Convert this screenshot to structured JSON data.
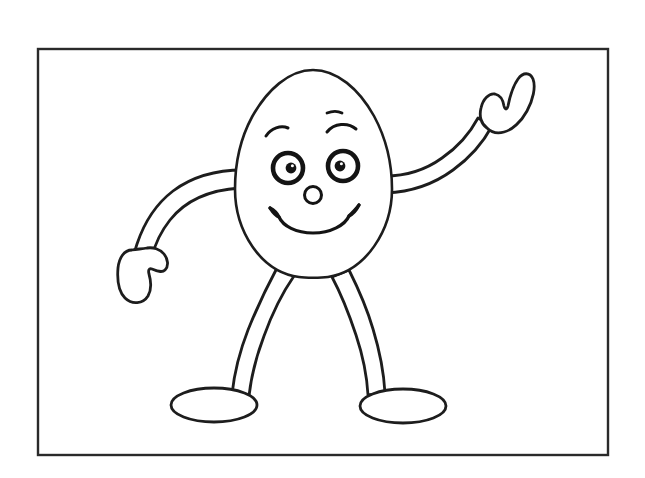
{
  "document": {
    "kind": "coloring-page",
    "title": "Egg Character Coloring Page",
    "subject": "smiling egg character waving",
    "background_color": "#ffffff",
    "ink_color": "#1a1a1a",
    "width": 645,
    "height": 478
  },
  "frame": {
    "name": "picture-frame",
    "x": 38,
    "y": 49,
    "width": 570,
    "height": 406,
    "stroke_color": "#2a2a2a",
    "stroke_width": 2.4
  },
  "character": {
    "name": "egg-character",
    "parts": [
      {
        "id": "body",
        "label": "Egg body",
        "shape": "egg-oval"
      },
      {
        "id": "left-arm",
        "label": "Left arm lowered",
        "shape": "tapered-curve"
      },
      {
        "id": "left-hand",
        "label": "Left mitten hand",
        "shape": "mitten"
      },
      {
        "id": "right-arm",
        "label": "Right arm raised waving",
        "shape": "tapered-curve"
      },
      {
        "id": "right-hand",
        "label": "Right mitten hand waving",
        "shape": "mitten"
      },
      {
        "id": "left-leg",
        "label": "Left leg",
        "shape": "tapered-curve"
      },
      {
        "id": "right-leg",
        "label": "Right leg",
        "shape": "tapered-curve"
      },
      {
        "id": "left-foot",
        "label": "Left oval foot",
        "shape": "ellipse"
      },
      {
        "id": "right-foot",
        "label": "Right oval foot",
        "shape": "ellipse"
      }
    ],
    "face": {
      "left_eye": {
        "cx": 288,
        "cy": 168,
        "r": 17,
        "pupil_cx": 291,
        "pupil_cy": 168,
        "pupil_r": 5.4
      },
      "right_eye": {
        "cx": 343,
        "cy": 166,
        "r": 17,
        "pupil_cx": 340,
        "pupil_cy": 166,
        "pupil_r": 5.4
      },
      "nose": {
        "cx": 313,
        "cy": 195,
        "r": 8.5
      },
      "mouth": {
        "label": "wide smile",
        "left_x": 272,
        "right_x": 358,
        "bottom_y": 232
      },
      "left_eyebrow": {
        "label": "short curved brow"
      },
      "right_eyebrow": {
        "label": "arched brow"
      },
      "right_eyebrow_dash": {
        "label": "small dash above right brow"
      }
    }
  },
  "colors": {
    "paper": "#ffffff",
    "outline": "#1d1d1d",
    "frame": "#2a2a2a",
    "pupil": "#141414"
  }
}
